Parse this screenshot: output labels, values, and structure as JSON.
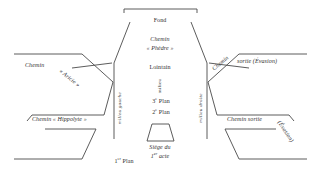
{
  "diagram": {
    "colors": {
      "stroke": "#4a4a4a",
      "text": "#2f2f2f",
      "background": "#ffffff"
    }
  },
  "labels": {
    "fond": "Fond",
    "chemin_phedre_line1": "Chemin",
    "chemin_phedre_line2": "« Phèdre »",
    "lointain": "Lointain",
    "milieu": "milieu",
    "plan3": "3e Plan",
    "plan3_num": "3",
    "plan3_ord": "e",
    "plan3_word": " Plan",
    "plan2_num": "2",
    "plan2_ord": "e",
    "plan2_word": " Plan",
    "plan1_num": "1",
    "plan1_ord": "er",
    "plan1_word": " Plan",
    "siege_line1": "Siège du",
    "siege_num": "1",
    "siege_ord": "er",
    "siege_word": " acte",
    "milieu_gauche": "milieu gauche",
    "milieu_droite": "milieu droite",
    "chemin_aricie_word": "Chemin",
    "chemin_aricie_name": "« Aricie »",
    "chemin_hippolyte": "Chemin « Hippolyte »",
    "chemin_sortie_evasion_word": "Chemin",
    "chemin_sortie_evasion_rest": "sortie (Évasion)",
    "chemin_sortie_low": "Chemin sortie",
    "evasion_low": "(Évasion)"
  }
}
